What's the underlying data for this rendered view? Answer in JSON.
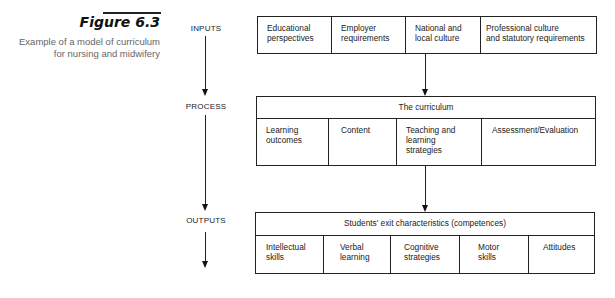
{
  "figure": {
    "title": "Figure 6.3",
    "caption_line1": "Example of a model of curriculum",
    "caption_line2": "for nursing and midwifery"
  },
  "stages": {
    "inputs": "INPUTS",
    "process": "PROCESS",
    "outputs": "OUTPUTS"
  },
  "inputs_box": {
    "cells": [
      {
        "line1": "Educational",
        "line2": "perspectives"
      },
      {
        "line1": "Employer",
        "line2": "requirements"
      },
      {
        "line1": "National and",
        "line2": "local culture"
      },
      {
        "line1": "Professional culture",
        "line2": "and statutory requirements"
      }
    ]
  },
  "process_box": {
    "header": "The curriculum",
    "cells": [
      {
        "line1": "Learning",
        "line2": "outcomes",
        "line3": ""
      },
      {
        "line1": "Content",
        "line2": "",
        "line3": ""
      },
      {
        "line1": "Teaching and",
        "line2": "learning",
        "line3": "strategies"
      },
      {
        "line1": "Assessment/Evaluation",
        "line2": "",
        "line3": ""
      }
    ]
  },
  "outputs_box": {
    "header": "Students' exit characteristics (competences)",
    "cells": [
      {
        "line1": "Intellectual",
        "line2": "skills"
      },
      {
        "line1": "Verbal",
        "line2": "learning"
      },
      {
        "line1": "Cognitive",
        "line2": "strategies"
      },
      {
        "line1": "Motor",
        "line2": "skills"
      },
      {
        "line1": "Attitudes",
        "line2": ""
      }
    ]
  }
}
